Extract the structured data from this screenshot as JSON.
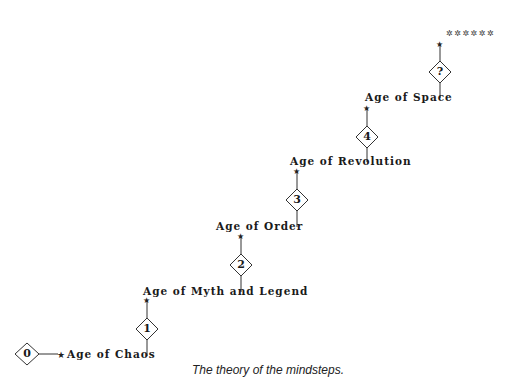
{
  "diagram": {
    "type": "staircase",
    "steps": [
      {
        "marker": "0",
        "label": "Age of Chaos"
      },
      {
        "marker": "1",
        "label": "Age of Myth and Legend"
      },
      {
        "marker": "2",
        "label": "Age of Order"
      },
      {
        "marker": "3",
        "label": "Age of Revolution"
      },
      {
        "marker": "4",
        "label": "Age of Space"
      },
      {
        "marker": "?",
        "label": "******"
      }
    ],
    "caption": "The theory of the mindsteps.",
    "colors": {
      "line": "#333333",
      "text": "#1a1a1a",
      "background": "#ffffff"
    }
  }
}
